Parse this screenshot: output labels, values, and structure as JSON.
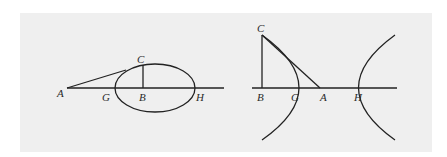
{
  "figure_left": {
    "title": "Ellipse with tangent line",
    "labels": {
      "A": "A",
      "B": "B",
      "C": "C",
      "G": "G",
      "H": "H"
    }
  },
  "figure_right": {
    "title": "Hyperbola with tangent line",
    "labels": {
      "A": "A",
      "B": "B",
      "C": "C",
      "G": "G",
      "H": "H"
    }
  },
  "colors": {
    "background": "#efefef",
    "stroke": "#222222",
    "page": "#ffffff"
  }
}
